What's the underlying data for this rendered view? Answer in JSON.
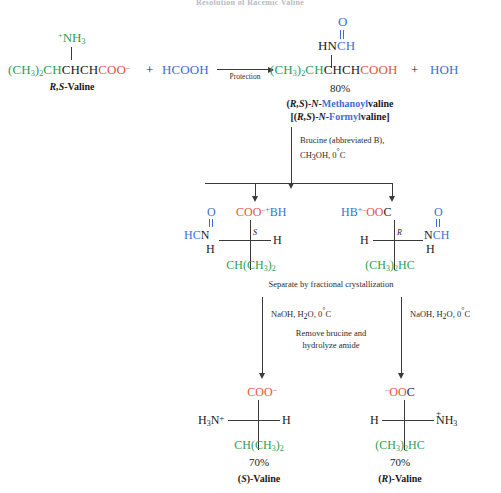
{
  "title": "Resolution of Racemic Valine",
  "reaction1": {
    "reactant": {
      "charge_group": "+NH3",
      "charge_sign": "+",
      "nh3": "NH",
      "nh3_sub": "3",
      "alkyl": "(CH",
      "alkyl_sub": "3",
      "alkyl_tail": ")",
      "alkyl_sub2": "2",
      "alkyl_ch": "CH",
      "backbone": "CHCH",
      "carboxylate": "COO",
      "carboxylate_charge": "–",
      "label": "(R,S)-Valine",
      "label_stereo": "R,S",
      "label_rest": "-Valine"
    },
    "plus1": "+",
    "formic_acid": "HCOOH",
    "arrow_label": "Protection",
    "product": {
      "o": "O",
      "hn": "HN",
      "ch": "CH",
      "alkyl": "(CH",
      "alkyl_sub": "3",
      "alkyl_tail": ")",
      "alkyl_sub2": "2",
      "alkyl_ch": "CH",
      "backbone": "CHCH",
      "carboxyl": "COOH",
      "yield": "80%",
      "name_line1_a": "(",
      "name_line1_stereo": "R,S",
      "name_line1_b": ")-",
      "name_line1_n": "N",
      "name_line1_c": "-",
      "name_line1_highlight": "Methanoyl",
      "name_line1_d": "valine",
      "name_line2_a": "[(",
      "name_line2_stereo": "R,S",
      "name_line2_b": ")-",
      "name_line2_n": "N",
      "name_line2_c": "-",
      "name_line2_highlight": "Formyl",
      "name_line2_d": "valine]"
    },
    "plus2": "+",
    "water": "HOH"
  },
  "step2": {
    "cond_line1": "Brucine (abbreviated B),",
    "cond_line2": "CH3OH, 0°C",
    "cond_line2_a": "CH",
    "cond_line2_sub": "3",
    "cond_line2_b": "OH, 0",
    "cond_line2_deg": "°",
    "cond_line2_c": "C"
  },
  "salts": {
    "left": {
      "o": "O",
      "hc": "HC",
      "n": "N",
      "h_below": "H",
      "coo": "COO",
      "coo_charge": "–",
      "bh_charge": "+",
      "bh": "BH",
      "stereo": "S",
      "h_right": "H",
      "alkyl_a": "CH(CH",
      "alkyl_sub": "3",
      "alkyl_b": ")",
      "alkyl_sub2": "2"
    },
    "right": {
      "hb": "HB",
      "hb_charge": "+",
      "ooc_charge": "–",
      "ooc": "OO",
      "c": "C",
      "o": "O",
      "n": "N",
      "ch": "CH",
      "h_below": "H",
      "stereo": "R",
      "h_left": "H",
      "alkyl_a": "(CH",
      "alkyl_sub": "3",
      "alkyl_b": ")",
      "alkyl_sub2": "2",
      "alkyl_c": "HC"
    }
  },
  "step3": {
    "separate": "Separate by fractional crystallization",
    "cond_left_a": "NaOH, H",
    "cond_left_sub": "2",
    "cond_left_b": "O, 0",
    "cond_left_deg": "°",
    "cond_left_c": "C",
    "cond_right_a": "NaOH, H",
    "cond_right_sub": "2",
    "cond_right_b": "O, 0",
    "cond_right_deg": "°",
    "cond_right_c": "C",
    "note_line1": "Remove brucine and",
    "note_line2": "hydrolyze amide"
  },
  "products": {
    "left": {
      "coo": "COO",
      "coo_charge": "–",
      "h3n_a": "H",
      "h3n_sub": "3",
      "h3n_b": "N",
      "h3n_charge": "+",
      "h_right": "H",
      "alkyl_a": "CH(CH",
      "alkyl_sub": "3",
      "alkyl_b": ")",
      "alkyl_sub2": "2",
      "yield": "70%",
      "name_a": "(",
      "name_stereo": "S",
      "name_b": ")-Valine"
    },
    "right": {
      "ooc_charge": "–",
      "ooc": "OO",
      "c": "C",
      "h_left": "H",
      "nh3_a": "NH",
      "nh3_sub": "3",
      "nh3_charge": "+",
      "alkyl_a": "(CH",
      "alkyl_sub": "3",
      "alkyl_b": ")",
      "alkyl_sub2": "2",
      "alkyl_c": "HC",
      "yield": "70%",
      "name_a": "(",
      "name_stereo": "R",
      "name_b": ")-Valine"
    }
  }
}
